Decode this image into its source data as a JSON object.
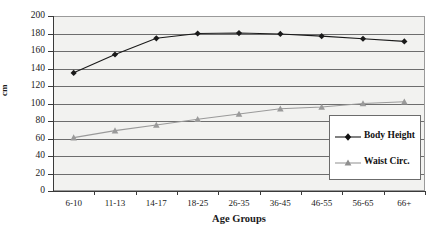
{
  "chart_data": {
    "type": "line",
    "title": "",
    "xlabel": "Age Groups",
    "ylabel": "cm",
    "categories": [
      "6-10",
      "11-13",
      "14-17",
      "18-25",
      "26-35",
      "36-45",
      "46-55",
      "56-65",
      "66+"
    ],
    "ylim": [
      0,
      200
    ],
    "yticks": [
      0,
      20,
      40,
      60,
      80,
      100,
      120,
      140,
      160,
      180,
      200
    ],
    "ytick_labels": [
      "0",
      "20",
      "40",
      "60",
      "80",
      "100",
      "120",
      "140",
      "160",
      "180",
      "200"
    ],
    "grid": true,
    "legend_position": "center-right",
    "series": [
      {
        "name": "Body Height",
        "color": "#1a1a1a",
        "marker": "diamond",
        "values": [
          135,
          156,
          174.5,
          180,
          180.5,
          179.5,
          177,
          174,
          171
        ]
      },
      {
        "name": "Waist Circ.",
        "color": "#9a9a9a",
        "marker": "triangle",
        "values": [
          61,
          69,
          75.5,
          82,
          88,
          94,
          96,
          100,
          102
        ]
      }
    ]
  },
  "legend": {
    "entries": [
      {
        "label": "Body Height"
      },
      {
        "label": "Waist Circ."
      }
    ]
  },
  "colors": {
    "body_height": "#1a1a1a",
    "waist_circ": "#9a9a9a",
    "plot_background": "#f2f2f0",
    "gridline": "#6d6d6d",
    "axis": "#3a3a3a",
    "text": "#1a1a1a"
  }
}
